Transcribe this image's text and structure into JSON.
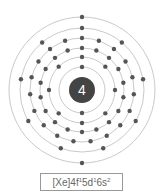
{
  "diagram": {
    "type": "bohr-model",
    "nucleus_label": "4",
    "nucleus_color": "#444444",
    "electron_color": "#555555",
    "shell_color": "#bbbbbb",
    "center": [
      82,
      90
    ],
    "nucleus_radius": 13,
    "shells": [
      {
        "radius": 23,
        "electrons": 2
      },
      {
        "radius": 33,
        "electrons": 8
      },
      {
        "radius": 42,
        "electrons": 18
      },
      {
        "radius": 52,
        "electrons": 19
      },
      {
        "radius": 62,
        "electrons": 9
      },
      {
        "radius": 73,
        "electrons": 2
      }
    ]
  },
  "config": {
    "core": "[Xe]",
    "parts": [
      {
        "orbital": "4f",
        "count": "1"
      },
      {
        "orbital": "5d",
        "count": "1"
      },
      {
        "orbital": "6s",
        "count": "2"
      }
    ]
  }
}
